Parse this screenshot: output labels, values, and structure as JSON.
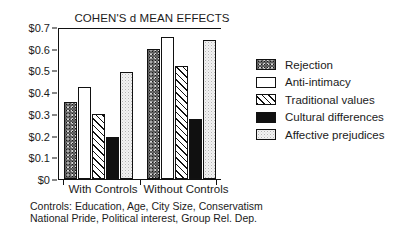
{
  "chart_data": {
    "type": "bar",
    "title": "COHEN'S d MEAN EFFECTS",
    "xlabel": "",
    "ylabel": "",
    "categories": [
      "With Controls",
      "Without Controls"
    ],
    "series": [
      {
        "name": "Rejection",
        "values": [
          0.355,
          0.598
        ],
        "pattern": "dark-speckle"
      },
      {
        "name": "Anti-intimacy",
        "values": [
          0.425,
          0.655
        ],
        "pattern": "white"
      },
      {
        "name": "Traditional values",
        "values": [
          0.3,
          0.52
        ],
        "pattern": "hatch"
      },
      {
        "name": "Cultural differences",
        "values": [
          0.195,
          0.275
        ],
        "pattern": "solid-black"
      },
      {
        "name": "Affective prejudices",
        "values": [
          0.495,
          0.64
        ],
        "pattern": "light-stipple"
      }
    ],
    "ylim": [
      0,
      0.7
    ],
    "ytick_values": [
      0,
      0.1,
      0.2,
      0.3,
      0.4,
      0.5,
      0.6,
      0.7
    ],
    "ytick_labels": [
      "$0",
      "$0.1",
      "$0.2",
      "$0.3",
      "$0.4",
      "$0.5",
      "$0.6",
      "$0.7"
    ],
    "grid": false,
    "legend_position": "right"
  },
  "legend": {
    "items": [
      {
        "label": "Rejection"
      },
      {
        "label": "Anti-intimacy"
      },
      {
        "label": "Traditional values"
      },
      {
        "label": "Cultural differences"
      },
      {
        "label": "Affective prejudices"
      }
    ]
  },
  "caption": {
    "lines": [
      "Controls: Education, Age, City Size, Conservatism",
      "National Pride, Political interest, Group Rel. Dep."
    ]
  },
  "colors": {
    "axis": "#111111",
    "text": "#1b1b1b",
    "background": "#ffffff"
  }
}
